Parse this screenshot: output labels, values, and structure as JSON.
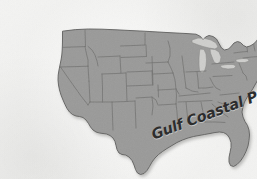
{
  "figure": {
    "type": "map",
    "name": "united-states-physiographic-map",
    "region": "United States (contiguous 48 states)",
    "projection_note": "conic, state outlines shown",
    "style": "grayscale halftone print scan",
    "background_color": "#f4f4f3",
    "land_fill_color": "#9a9a99",
    "state_border_color": "#6f6f6e",
    "coast_outline_color": "#5d5d5c",
    "lake_fill_color": "#cfcfcd",
    "shadow_color": "#cfcfcd"
  },
  "labels": [
    {
      "id": "gulf-coastal-plain",
      "text": "Gulf Coastal Plain",
      "color": "#2d2d2d",
      "rotation_degrees": -20.5,
      "font_style": "bold italic condensed",
      "font_size_px": 14.5,
      "placement": "across the Gulf of Mexico coastline from Texas to Georgia"
    }
  ],
  "features": {
    "great_lakes_shown": "true",
    "florida_peninsula_shown": "true",
    "state_boundaries_shown": "true",
    "legend_shown": "false",
    "title_shown": "false",
    "scale_bar_shown": "false",
    "compass_shown": "false"
  }
}
